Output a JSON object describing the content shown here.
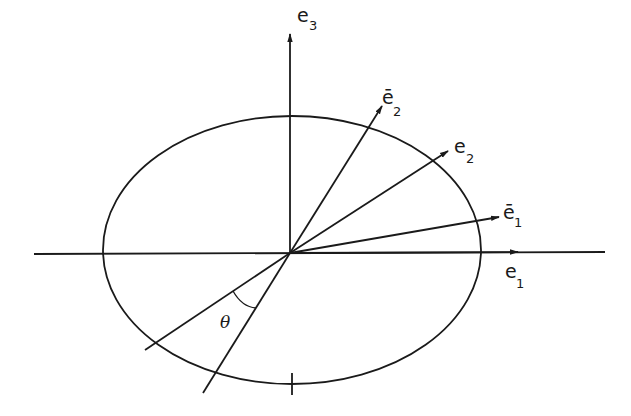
{
  "diagram": {
    "type": "vector-basis-rotation",
    "stroke_color": "#1a1a1a",
    "background": "#ffffff",
    "origin": [
      290,
      253
    ],
    "ellipse": {
      "cx": 292,
      "cy": 250,
      "rx": 189,
      "ry": 134
    },
    "axes": {
      "horizontal": {
        "from": [
          34,
          254
        ],
        "to": [
          605,
          252
        ]
      },
      "vertical": {
        "from": [
          290,
          253
        ],
        "to": [
          290,
          30
        ]
      }
    },
    "vectors": [
      {
        "id": "e3",
        "base": "e",
        "sub": "3",
        "bar": false,
        "tip": [
          290,
          36
        ]
      },
      {
        "id": "ebar2",
        "base": "e",
        "sub": "2",
        "bar": true,
        "tip": [
          382,
          107
        ]
      },
      {
        "id": "e2",
        "base": "e",
        "sub": "2",
        "bar": false,
        "tip": [
          447,
          152
        ]
      },
      {
        "id": "ebar1",
        "base": "e",
        "sub": "1",
        "bar": true,
        "tip": [
          500,
          216
        ]
      },
      {
        "id": "e1",
        "base": "e",
        "sub": "1",
        "bar": false,
        "tip": [
          518,
          251
        ]
      }
    ],
    "labels": {
      "e3": {
        "main": "e",
        "sub": "3"
      },
      "ebar2": {
        "main": "ē",
        "sub": "2"
      },
      "e2": {
        "main": "e",
        "sub": "2"
      },
      "ebar1": {
        "main": "ē",
        "sub": "1"
      },
      "e1": {
        "main": "e",
        "sub": "1"
      },
      "angle": "θ"
    }
  }
}
